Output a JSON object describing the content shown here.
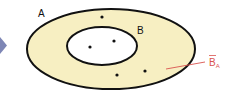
{
  "diagram": {
    "type": "venn-subset",
    "colors": {
      "outer_fill": "#f7efc2",
      "inner_fill": "#ffffff",
      "stroke": "#111111",
      "complement_label": "#d9534f",
      "arrow": "#7e86b5"
    },
    "sets": [
      {
        "name": "A",
        "label": "A",
        "role": "universal-outer"
      },
      {
        "name": "B",
        "label": "B",
        "role": "subset-inner"
      }
    ],
    "complement": {
      "base": "B",
      "overbar": true,
      "subscript": "A"
    },
    "points": {
      "inside_B": 2,
      "in_A_not_B": 3
    }
  }
}
